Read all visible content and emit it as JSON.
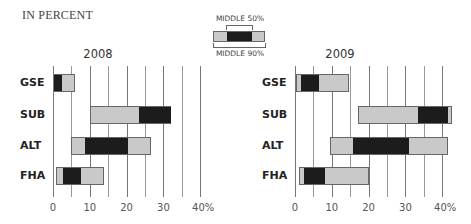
{
  "unit_label": "IN PERCENT",
  "legend": {
    "middle50_label": "MIDDLE 50%",
    "middle90_label": "MIDDLE 90%"
  },
  "colors": {
    "outer_range": "#c9c9c9",
    "inner_range": "#1c1c1c",
    "gridline": "#777777"
  },
  "chart_data": [
    {
      "type": "bar",
      "subtype": "range (floating box: middle 90% light, middle 50% dark)",
      "title": "2008",
      "xlabel": "",
      "ylabel": "",
      "unit": "percent",
      "xlim": [
        0,
        40
      ],
      "xticks": [
        "0",
        "10",
        "20",
        "30",
        "40%"
      ],
      "gridlines": [
        0,
        5,
        10,
        15,
        20,
        25,
        30,
        35,
        40
      ],
      "categories": [
        "GSE",
        "SUB",
        "ALT",
        "FHA"
      ],
      "series": [
        {
          "name": "Middle 90% low",
          "values": [
            0.3,
            10,
            4.8,
            0.7
          ]
        },
        {
          "name": "Middle 50% low",
          "values": [
            0.3,
            23.3,
            8.6,
            2.6
          ]
        },
        {
          "name": "Middle 50% high",
          "values": [
            2.5,
            32,
            20.5,
            7.5
          ]
        },
        {
          "name": "Middle 90% high",
          "values": [
            6,
            32,
            26.5,
            13.8
          ]
        }
      ]
    },
    {
      "type": "bar",
      "subtype": "range (floating box: middle 90% light, middle 50% dark)",
      "title": "2009",
      "xlabel": "",
      "ylabel": "",
      "unit": "percent",
      "xlim": [
        0,
        40
      ],
      "xticks": [
        "0",
        "10",
        "20",
        "30",
        "40%"
      ],
      "gridlines": [
        0,
        5,
        10,
        15,
        20,
        25,
        30,
        35,
        40
      ],
      "categories": [
        "GSE",
        "SUB",
        "ALT",
        "FHA"
      ],
      "series": [
        {
          "name": "Middle 90% low",
          "values": [
            0.3,
            17,
            9.4,
            1
          ]
        },
        {
          "name": "Middle 50% low",
          "values": [
            1.6,
            33.5,
            15.7,
            2.4
          ]
        },
        {
          "name": "Middle 50% high",
          "values": [
            6.6,
            41.6,
            31,
            8.2
          ]
        },
        {
          "name": "Middle 90% high",
          "values": [
            14.7,
            42.7,
            41.5,
            20.2
          ]
        }
      ]
    }
  ]
}
